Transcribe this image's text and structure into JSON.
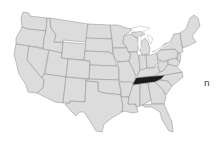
{
  "map": {
    "title": "United States map with highlighted state",
    "highlighted_state": "Tennessee",
    "colors": {
      "base": "#dcdcdc",
      "border": "#8a8a8a",
      "highlight": "#1a1a1a",
      "background": "#ffffff"
    },
    "states": [
      {
        "name": "Washington",
        "highlighted": false
      },
      {
        "name": "Oregon",
        "highlighted": false
      },
      {
        "name": "California",
        "highlighted": false
      },
      {
        "name": "Nevada",
        "highlighted": false
      },
      {
        "name": "Idaho",
        "highlighted": false
      },
      {
        "name": "Montana",
        "highlighted": false
      },
      {
        "name": "Wyoming",
        "highlighted": false
      },
      {
        "name": "Utah",
        "highlighted": false
      },
      {
        "name": "Arizona",
        "highlighted": false
      },
      {
        "name": "Colorado",
        "highlighted": false
      },
      {
        "name": "New Mexico",
        "highlighted": false
      },
      {
        "name": "North Dakota",
        "highlighted": false
      },
      {
        "name": "South Dakota",
        "highlighted": false
      },
      {
        "name": "Nebraska",
        "highlighted": false
      },
      {
        "name": "Kansas",
        "highlighted": false
      },
      {
        "name": "Oklahoma",
        "highlighted": false
      },
      {
        "name": "Texas",
        "highlighted": false
      },
      {
        "name": "Minnesota",
        "highlighted": false
      },
      {
        "name": "Iowa",
        "highlighted": false
      },
      {
        "name": "Missouri",
        "highlighted": false
      },
      {
        "name": "Arkansas",
        "highlighted": false
      },
      {
        "name": "Louisiana",
        "highlighted": false
      },
      {
        "name": "Wisconsin",
        "highlighted": false
      },
      {
        "name": "Illinois",
        "highlighted": false
      },
      {
        "name": "Michigan",
        "highlighted": false
      },
      {
        "name": "Indiana",
        "highlighted": false
      },
      {
        "name": "Ohio",
        "highlighted": false
      },
      {
        "name": "Kentucky",
        "highlighted": false
      },
      {
        "name": "Tennessee",
        "highlighted": true
      },
      {
        "name": "Mississippi",
        "highlighted": false
      },
      {
        "name": "Alabama",
        "highlighted": false
      },
      {
        "name": "Georgia",
        "highlighted": false
      },
      {
        "name": "Florida",
        "highlighted": false
      },
      {
        "name": "South Carolina",
        "highlighted": false
      },
      {
        "name": "North Carolina",
        "highlighted": false
      },
      {
        "name": "Virginia",
        "highlighted": false
      },
      {
        "name": "West Virginia",
        "highlighted": false
      },
      {
        "name": "Pennsylvania",
        "highlighted": false
      },
      {
        "name": "New York",
        "highlighted": false
      },
      {
        "name": "New England",
        "highlighted": false
      }
    ]
  },
  "edge_text": "n"
}
